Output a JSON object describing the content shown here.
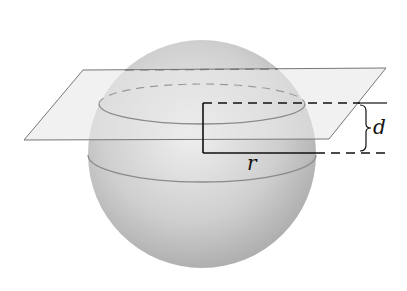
{
  "diagram": {
    "labels": {
      "distance": "d",
      "radius": "r"
    },
    "colors": {
      "sphere_light": "#f0f0f0",
      "sphere_dark": "#a8a8a8",
      "plane_fill": "#e4e4e4",
      "plane_stroke": "#777777",
      "line": "#111111"
    }
  }
}
